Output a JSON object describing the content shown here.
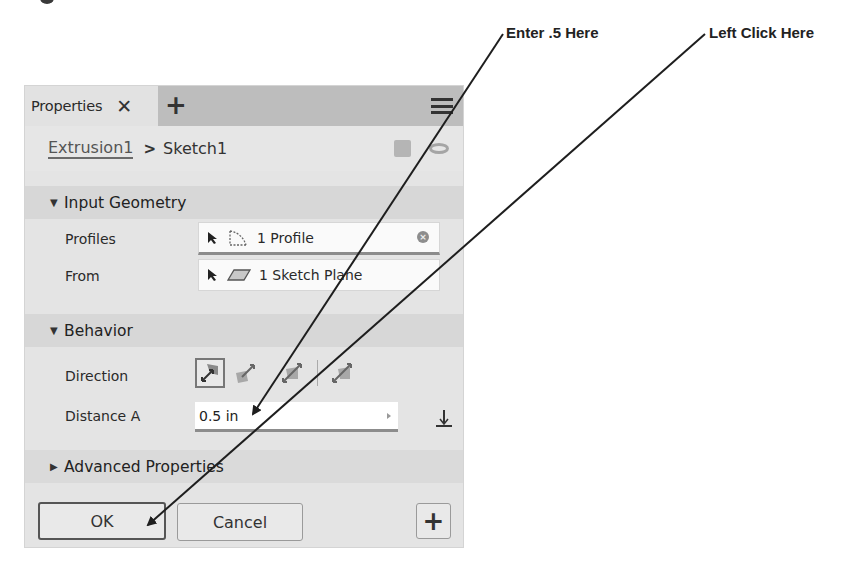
{
  "callouts": {
    "enter_value": "Enter .5 Here",
    "left_click": "Left Click Here"
  },
  "panel": {
    "tab": {
      "label": "Properties",
      "close_icon": "close-icon",
      "add_icon": "plus-icon"
    },
    "menu_icon": "hamburger-menu-icon",
    "breadcrumb": {
      "parent": "Extrusion1",
      "separator": ">",
      "current": "Sketch1"
    },
    "sections": {
      "input_geometry": {
        "title": "Input Geometry",
        "expanded": true,
        "rows": {
          "profiles": {
            "label": "Profiles",
            "value": "1 Profile"
          },
          "from": {
            "label": "From",
            "value": "1 Sketch Plane"
          }
        }
      },
      "behavior": {
        "title": "Behavior",
        "expanded": true,
        "rows": {
          "direction": {
            "label": "Direction",
            "options": [
              "default",
              "flipped",
              "symmetric",
              "asymmetric"
            ],
            "selected": "default"
          },
          "distance_a": {
            "label": "Distance A",
            "value": "0.5 in"
          }
        }
      },
      "advanced": {
        "title": "Advanced Properties",
        "expanded": false
      }
    },
    "buttons": {
      "ok": "OK",
      "cancel": "Cancel",
      "plus": "+"
    }
  },
  "colors": {
    "panel_bg": "#e4e4e4",
    "tabbar_bg": "#bdbdbd",
    "section_bg": "#d7d7d7",
    "field_bg": "#fafafa",
    "arrow": "#1e1e1e"
  }
}
